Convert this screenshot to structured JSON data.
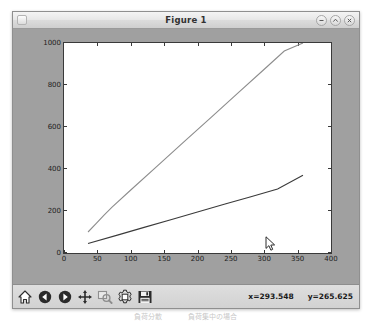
{
  "window": {
    "title": "Figure 1",
    "app_icon": "figure-icon",
    "controls": [
      {
        "name": "minimize-button",
        "glyph": "–"
      },
      {
        "name": "maximize-button",
        "glyph": "△"
      },
      {
        "name": "close-button",
        "glyph": "×"
      }
    ]
  },
  "toolbar": {
    "buttons": [
      {
        "name": "home-button",
        "icon": "home-icon",
        "label": "Reset original view",
        "disabled": false
      },
      {
        "name": "back-button",
        "icon": "back-arrow-icon",
        "label": "Back to previous view",
        "disabled": false
      },
      {
        "name": "forward-button",
        "icon": "forward-arrow-icon",
        "label": "Forward to next view",
        "disabled": false
      },
      {
        "name": "pan-button",
        "icon": "pan-move-icon",
        "label": "Pan axes with left mouse, zoom with right",
        "disabled": false
      },
      {
        "name": "zoom-rect-button",
        "icon": "zoom-rect-icon",
        "label": "Zoom to rectangle",
        "disabled": true
      },
      {
        "name": "configure-subplots-button",
        "icon": "gear-icon",
        "label": "Configure subplots",
        "disabled": false
      },
      {
        "name": "save-figure-button",
        "icon": "floppy-disk-icon",
        "label": "Save the figure",
        "disabled": false
      }
    ]
  },
  "status": {
    "x_readout": "x=293.548",
    "y_readout": "y=265.625"
  },
  "caption": {
    "left_text": "負荷分散",
    "right_text": "負荷集中の場合"
  },
  "chart_data": {
    "type": "line",
    "title": "",
    "xlabel": "",
    "ylabel": "",
    "xlim": [
      0,
      400
    ],
    "ylim": [
      0,
      1000
    ],
    "xticks": [
      0,
      50,
      100,
      150,
      200,
      250,
      300,
      350,
      400
    ],
    "yticks": [
      0,
      200,
      400,
      600,
      800,
      1000
    ],
    "grid": false,
    "legend": null,
    "series": [
      {
        "name": "upper-line",
        "color": "#8c8c8c",
        "x": [
          36,
          48,
          60,
          72,
          100,
          140,
          180,
          220,
          260,
          300,
          330,
          358
        ],
        "y": [
          100,
          140,
          180,
          218,
          300,
          415,
          530,
          645,
          760,
          875,
          962,
          1000
        ]
      },
      {
        "name": "lower-line",
        "color": "#3a3a3a",
        "x": [
          36,
          80,
          120,
          160,
          200,
          240,
          280,
          320,
          358
        ],
        "y": [
          45,
          85,
          122,
          158,
          195,
          232,
          268,
          305,
          370
        ]
      }
    ]
  },
  "cursor": {
    "name": "mouse-pointer",
    "x": 293.548,
    "y": 265.625
  }
}
